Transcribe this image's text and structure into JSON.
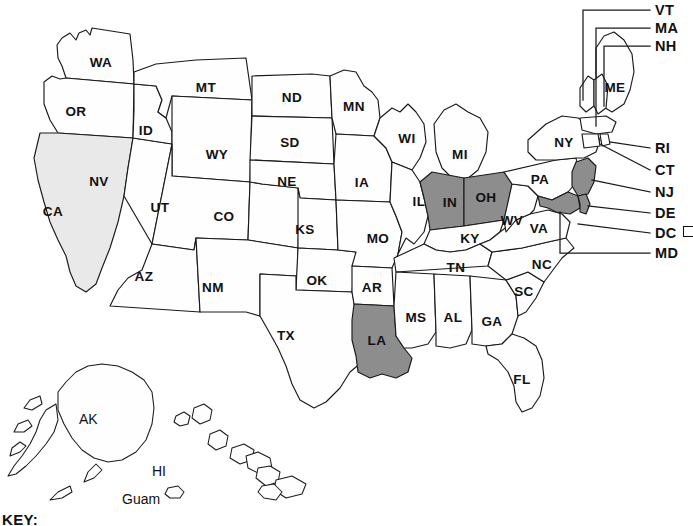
{
  "map": {
    "title": "United States map with shaded states",
    "key_label": "KEY:",
    "colors": {
      "outline": "#1a1a1a",
      "unshaded": "#fefefe",
      "light_shade": "#e9e9e9",
      "dark_shade": "#8d8d8d",
      "background": "#ffffff"
    },
    "states": [
      {
        "code": "WA",
        "name": "Washington",
        "shade": "none",
        "lx": 101,
        "ly": 63
      },
      {
        "code": "OR",
        "name": "Oregon",
        "shade": "none",
        "lx": 76,
        "ly": 112
      },
      {
        "code": "CA",
        "name": "California",
        "shade": "light",
        "lx": 53,
        "ly": 212
      },
      {
        "code": "NV",
        "name": "Nevada",
        "shade": "none",
        "lx": 99,
        "ly": 182
      },
      {
        "code": "ID",
        "name": "Idaho",
        "shade": "none",
        "lx": 146,
        "ly": 131
      },
      {
        "code": "MT",
        "name": "Montana",
        "shade": "none",
        "lx": 206,
        "ly": 88
      },
      {
        "code": "WY",
        "name": "Wyoming",
        "shade": "none",
        "lx": 217,
        "ly": 155
      },
      {
        "code": "UT",
        "name": "Utah",
        "shade": "none",
        "lx": 160,
        "ly": 208
      },
      {
        "code": "AZ",
        "name": "Arizona",
        "shade": "none",
        "lx": 144,
        "ly": 277
      },
      {
        "code": "CO",
        "name": "Colorado",
        "shade": "none",
        "lx": 224,
        "ly": 217
      },
      {
        "code": "NM",
        "name": "New Mexico",
        "shade": "none",
        "lx": 213,
        "ly": 288
      },
      {
        "code": "ND",
        "name": "North Dakota",
        "shade": "none",
        "lx": 292,
        "ly": 98
      },
      {
        "code": "SD",
        "name": "South Dakota",
        "shade": "none",
        "lx": 290,
        "ly": 143
      },
      {
        "code": "NE",
        "name": "Nebraska",
        "shade": "none",
        "lx": 287,
        "ly": 182
      },
      {
        "code": "KS",
        "name": "Kansas",
        "shade": "none",
        "lx": 305,
        "ly": 230
      },
      {
        "code": "OK",
        "name": "Oklahoma",
        "shade": "none",
        "lx": 317,
        "ly": 281
      },
      {
        "code": "TX",
        "name": "Texas",
        "shade": "none",
        "lx": 286,
        "ly": 336
      },
      {
        "code": "MN",
        "name": "Minnesota",
        "shade": "none",
        "lx": 354,
        "ly": 107
      },
      {
        "code": "IA",
        "name": "Iowa",
        "shade": "none",
        "lx": 362,
        "ly": 183
      },
      {
        "code": "MO",
        "name": "Missouri",
        "shade": "none",
        "lx": 378,
        "ly": 239
      },
      {
        "code": "AR",
        "name": "Arkansas",
        "shade": "none",
        "lx": 372,
        "ly": 288
      },
      {
        "code": "LA",
        "name": "Louisiana",
        "shade": "dark",
        "lx": 377,
        "ly": 341
      },
      {
        "code": "WI",
        "name": "Wisconsin",
        "shade": "none",
        "lx": 407,
        "ly": 139
      },
      {
        "code": "IL",
        "name": "Illinois",
        "shade": "none",
        "lx": 419,
        "ly": 202
      },
      {
        "code": "MI",
        "name": "Michigan",
        "shade": "none",
        "lx": 460,
        "ly": 155
      },
      {
        "code": "IN",
        "name": "Indiana",
        "shade": "dark",
        "lx": 450,
        "ly": 203
      },
      {
        "code": "OH",
        "name": "Ohio",
        "shade": "dark",
        "lx": 486,
        "ly": 198
      },
      {
        "code": "KY",
        "name": "Kentucky",
        "shade": "none",
        "lx": 470,
        "ly": 239
      },
      {
        "code": "TN",
        "name": "Tennessee",
        "shade": "none",
        "lx": 456,
        "ly": 268
      },
      {
        "code": "MS",
        "name": "Mississippi",
        "shade": "none",
        "lx": 416,
        "ly": 318
      },
      {
        "code": "AL",
        "name": "Alabama",
        "shade": "none",
        "lx": 453,
        "ly": 318
      },
      {
        "code": "GA",
        "name": "Georgia",
        "shade": "none",
        "lx": 492,
        "ly": 322
      },
      {
        "code": "FL",
        "name": "Florida",
        "shade": "none",
        "lx": 522,
        "ly": 380
      },
      {
        "code": "SC",
        "name": "South Carolina",
        "shade": "none",
        "lx": 524,
        "ly": 292
      },
      {
        "code": "NC",
        "name": "North Carolina",
        "shade": "none",
        "lx": 542,
        "ly": 265
      },
      {
        "code": "VA",
        "name": "Virginia",
        "shade": "none",
        "lx": 539,
        "ly": 229
      },
      {
        "code": "WV",
        "name": "West Virginia",
        "shade": "none",
        "lx": 512,
        "ly": 221
      },
      {
        "code": "PA",
        "name": "Pennsylvania",
        "shade": "none",
        "lx": 540,
        "ly": 180
      },
      {
        "code": "NY",
        "name": "New York",
        "shade": "none",
        "lx": 564,
        "ly": 143
      },
      {
        "code": "ME",
        "name": "Maine",
        "shade": "none",
        "lx": 615,
        "ly": 88
      }
    ],
    "callouts": [
      {
        "code": "VT",
        "name": "Vermont",
        "label_x": 655,
        "label_y": 3
      },
      {
        "code": "MA",
        "name": "Massachusetts",
        "label_x": 655,
        "label_y": 21
      },
      {
        "code": "NH",
        "name": "New Hampshire",
        "label_x": 655,
        "label_y": 39
      },
      {
        "code": "RI",
        "name": "Rhode Island",
        "label_x": 655,
        "label_y": 141
      },
      {
        "code": "CT",
        "name": "Connecticut",
        "label_x": 655,
        "label_y": 163
      },
      {
        "code": "NJ",
        "name": "New Jersey",
        "label_x": 655,
        "label_y": 185
      },
      {
        "code": "DE",
        "name": "Delaware",
        "label_x": 655,
        "label_y": 206
      },
      {
        "code": "DC",
        "name": "District of Columbia",
        "label_x": 655,
        "label_y": 226,
        "has_square": true
      },
      {
        "code": "MD",
        "name": "Maryland",
        "label_x": 655,
        "label_y": 246
      }
    ],
    "territories": [
      {
        "code": "AK",
        "name": "Alaska",
        "label_x": 79,
        "label_y": 412
      },
      {
        "code": "HI",
        "name": "Hawaii",
        "label_x": 152,
        "label_y": 464
      },
      {
        "code": "Guam",
        "name": "Guam",
        "label_x": 122,
        "label_y": 492
      }
    ]
  }
}
